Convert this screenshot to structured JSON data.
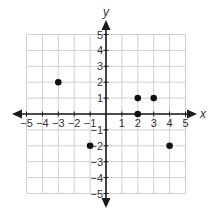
{
  "chart_data": {
    "type": "scatter",
    "title": "",
    "xlabel": "x",
    "ylabel": "y",
    "xlim": [
      -5,
      5
    ],
    "ylim": [
      -5,
      5
    ],
    "grid": true,
    "xticks": [
      -5,
      -4,
      -3,
      -2,
      -1,
      1,
      2,
      3,
      4,
      5
    ],
    "yticks": [
      -5,
      -4,
      -3,
      -2,
      -1,
      1,
      2,
      3,
      4,
      5
    ],
    "series": [
      {
        "name": "points",
        "points": [
          {
            "x": -3,
            "y": 2
          },
          {
            "x": 2,
            "y": 1
          },
          {
            "x": 3,
            "y": 1
          },
          {
            "x": 2,
            "y": 0
          },
          {
            "x": -1,
            "y": -2
          },
          {
            "x": 4,
            "y": -2
          }
        ]
      }
    ],
    "colors": {
      "grid": "#cfcfcf",
      "axis": "#1a1a1a",
      "point": "#111111",
      "label": "#333333"
    }
  },
  "layout": {
    "origin_x": 106,
    "origin_y": 114,
    "unit": 15.9,
    "x_arrow_left": 12,
    "x_arrow_right": 197,
    "y_arrow_top": 20,
    "y_arrow_bottom": 208
  }
}
